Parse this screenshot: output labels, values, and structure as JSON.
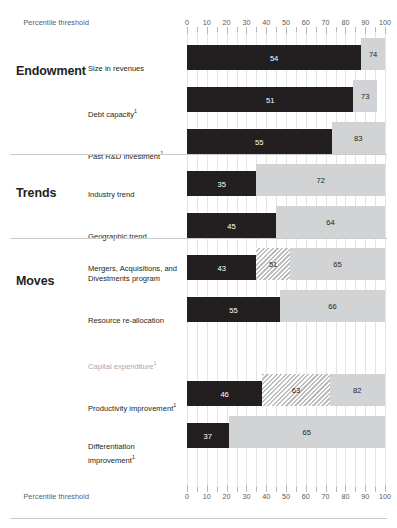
{
  "chart_data": {
    "type": "bar",
    "title": "",
    "subtitle": "",
    "xlabel": "Percentile threshold",
    "ylabel": "",
    "xlim": [
      0,
      100
    ],
    "tick_step": 10,
    "minor_tick_step": 5,
    "grid": true,
    "legend_position": "none",
    "tick_labels": [
      "0",
      "10",
      "20",
      "30",
      "40",
      "50",
      "60",
      "70",
      "80",
      "90",
      "100"
    ],
    "axis_caption_top": "Percentile threshold",
    "axis_caption_bottom": "Percentile threshold",
    "colors": {
      "dark_bar": "#231f20",
      "light_bar": "#d2d3d5",
      "hatch_bar": "#bcbec0",
      "grid": "#e3e4e6",
      "rule": "#c9cacc",
      "muted_text": "#a7a9ac"
    },
    "sections": [
      {
        "name": "Endowment",
        "rows": [
          {
            "label": "Size in revenues",
            "footnote": false,
            "muted": false,
            "dark": {
              "value": 54,
              "start": 0,
              "end": 88,
              "label": "54"
            },
            "hatch": null,
            "light": {
              "value": 74,
              "start": 88,
              "end": 100,
              "label": "74"
            }
          },
          {
            "label": "Debt capacity",
            "footnote": true,
            "muted": false,
            "dark": {
              "value": 51,
              "start": 0,
              "end": 84,
              "label": "51"
            },
            "hatch": null,
            "light": {
              "value": 73,
              "start": 84,
              "end": 96,
              "label": "73"
            }
          },
          {
            "label": "Past R&D investment",
            "footnote": true,
            "muted": false,
            "dark": {
              "value": 55,
              "start": 0,
              "end": 73,
              "label": "55"
            },
            "hatch": null,
            "light": {
              "value": 83,
              "start": 73,
              "end": 100,
              "label": "83"
            }
          }
        ]
      },
      {
        "name": "Trends",
        "rows": [
          {
            "label": "Industry trend",
            "footnote": false,
            "muted": false,
            "dark": {
              "value": 35,
              "start": 0,
              "end": 35,
              "label": "35"
            },
            "hatch": null,
            "light": {
              "value": 72,
              "start": 35,
              "end": 100,
              "label": "72"
            }
          },
          {
            "label": "Geographic trend",
            "footnote": false,
            "muted": false,
            "dark": {
              "value": 45,
              "start": 0,
              "end": 45,
              "label": "45"
            },
            "hatch": null,
            "light": {
              "value": 64,
              "start": 45,
              "end": 100,
              "label": "64"
            }
          }
        ]
      },
      {
        "name": "Moves",
        "rows": [
          {
            "label": "Mergers, Acquisitions, and Divestments program",
            "footnote": false,
            "muted": false,
            "dark": {
              "value": 43,
              "start": 0,
              "end": 35,
              "label": "43"
            },
            "hatch": {
              "value": 51,
              "start": 35,
              "end": 52,
              "label": "51"
            },
            "light": {
              "value": 65,
              "start": 52,
              "end": 100,
              "label": "65"
            }
          },
          {
            "label": "Resource re-allocation",
            "footnote": false,
            "muted": false,
            "dark": {
              "value": 55,
              "start": 0,
              "end": 47,
              "label": "55"
            },
            "hatch": null,
            "light": {
              "value": 66,
              "start": 47,
              "end": 100,
              "label": "66"
            }
          },
          {
            "label": "Capital expenditure",
            "footnote": true,
            "muted": true,
            "dark": null,
            "hatch": null,
            "light": null
          },
          {
            "label": "Productivity improvement",
            "footnote": true,
            "muted": false,
            "dark": {
              "value": 46,
              "start": 0,
              "end": 38,
              "label": "46"
            },
            "hatch": {
              "value": 63,
              "start": 38,
              "end": 72,
              "label": "63"
            },
            "light": {
              "value": 82,
              "start": 72,
              "end": 100,
              "label": "82"
            }
          },
          {
            "label": "Differentiation improvement",
            "footnote": true,
            "muted": false,
            "dark": {
              "value": 37,
              "start": 0,
              "end": 21,
              "label": "37"
            },
            "hatch": null,
            "light": {
              "value": 65,
              "start": 21,
              "end": 100,
              "label": "65"
            }
          }
        ]
      }
    ]
  }
}
